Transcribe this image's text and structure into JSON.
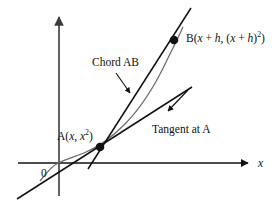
{
  "figure": {
    "background_color": "#ffffff",
    "width": 275,
    "height": 204
  },
  "axes": {
    "x_label": "x",
    "origin_label": "0",
    "x_axis_color": "#111111",
    "y_axis_color": "#4a4a4a",
    "x_axis": {
      "x1": 18,
      "y1": 163,
      "x2": 252,
      "y2": 163
    },
    "y_axis": {
      "x1": 59,
      "y1": 196,
      "x2": 59,
      "y2": 12
    }
  },
  "curve": {
    "name": "parabola",
    "equation": "y = x^2",
    "color": "#6d6d6d",
    "stroke_width": 1.2
  },
  "chord": {
    "name": "chord-ab",
    "color": "#111111",
    "stroke_width": 1.5
  },
  "tangent": {
    "name": "tangent-at-a",
    "color": "#111111",
    "stroke_width": 1.5
  },
  "points": [
    {
      "id": "A",
      "label_prefix": "A(",
      "label_var1": "x",
      "label_sep": ", ",
      "label_var2": "x",
      "label_exp": "2",
      "label_suffix": ")",
      "label_full": "A(x, x²)",
      "cx": 100,
      "cy": 147,
      "r": 4.2,
      "color": "#111111"
    },
    {
      "id": "B",
      "label_prefix": "B(",
      "label_var1": "x",
      "label_plus": " + ",
      "label_var2": "h",
      "label_sep": ", (",
      "label_var3": "x",
      "label_var4": "h",
      "label_exp": "2",
      "label_suffix": ")",
      "label_full": "B(x + h, (x + h)²)",
      "cx": 174,
      "cy": 40,
      "r": 4.2,
      "color": "#111111"
    }
  ],
  "annotations": [
    {
      "id": "chord-annotation",
      "text": "Chord AB",
      "arrow_from": {
        "x": 116,
        "y": 74
      },
      "arrow_to": {
        "x": 131,
        "y": 94
      },
      "color": "#111111"
    },
    {
      "id": "tangent-annotation",
      "text": "Tangent at A",
      "arrow_from": {
        "x": 187,
        "y": 91
      },
      "arrow_to": {
        "x": 167,
        "y": 112
      },
      "color": "#111111"
    }
  ]
}
